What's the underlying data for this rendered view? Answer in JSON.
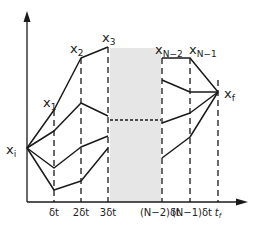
{
  "diagram": {
    "type": "discretized trajectory paths diagram",
    "axes": {
      "x_axis": "time",
      "y_axis": "state"
    },
    "start_label": {
      "base": "x",
      "sub": "i"
    },
    "end_label": {
      "base": "x",
      "sub": "f"
    },
    "state_labels": [
      {
        "base": "x",
        "sub": "1"
      },
      {
        "base": "x",
        "sub": "2"
      },
      {
        "base": "x",
        "sub": "3"
      },
      {
        "base": "x",
        "sub": "N−2"
      },
      {
        "base": "x",
        "sub": "N−1"
      }
    ],
    "time_ticks": [
      "δt",
      "2δt",
      "3δt",
      "(N−2)δt",
      "(N−1)δt",
      "t"
    ],
    "tf_sub": "f",
    "colors": {
      "line": "#1a1a1a",
      "gap_band": "#e6e6e6"
    }
  }
}
